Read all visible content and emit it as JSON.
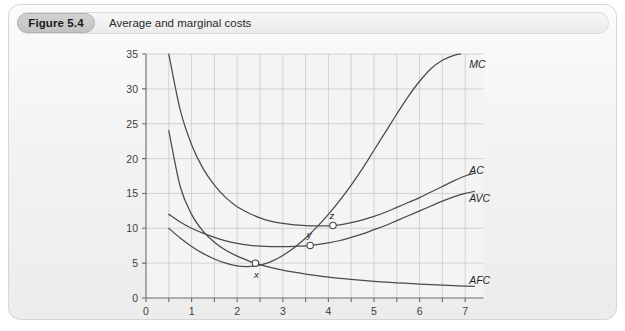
{
  "figure": {
    "badge": "Figure 5.4",
    "caption": "Average and marginal costs"
  },
  "chart_data": {
    "type": "line",
    "title": "Average and marginal costs",
    "xlabel": "",
    "ylabel": "",
    "xlim": [
      0,
      7.4
    ],
    "ylim": [
      0,
      35
    ],
    "xticks": [
      "0",
      "1",
      "2",
      "3",
      "4",
      "5",
      "6",
      "7"
    ],
    "xtick_values": [
      0,
      1,
      2,
      3,
      4,
      5,
      6,
      7
    ],
    "yticks": [
      "0",
      "5",
      "10",
      "15",
      "20",
      "25",
      "30",
      "35"
    ],
    "ytick_values": [
      0,
      5,
      10,
      15,
      20,
      25,
      30,
      35
    ],
    "grid": true,
    "grid_x_step": 0.5,
    "grid_y_step": 5,
    "legend_position": "inline-right",
    "series": [
      {
        "name": "MC",
        "label": "MC",
        "label_x": 7.0,
        "label_y": 33.6,
        "x": [
          0.5,
          0.75,
          1.0,
          1.25,
          1.5,
          1.75,
          2.0,
          2.2,
          2.4,
          2.6,
          2.8,
          3.0,
          3.25,
          3.5,
          3.75,
          4.0,
          4.25,
          4.5,
          4.75,
          5.0,
          5.25,
          5.5,
          5.75,
          6.0,
          6.25,
          6.5,
          6.75,
          6.9
        ],
        "y": [
          10.0,
          8.6,
          7.4,
          6.4,
          5.6,
          5.0,
          4.6,
          4.5,
          4.6,
          4.9,
          5.4,
          6.1,
          7.2,
          8.6,
          10.2,
          12.0,
          14.0,
          16.2,
          18.6,
          21.2,
          23.8,
          26.4,
          28.9,
          31.1,
          32.9,
          34.1,
          34.8,
          35.0
        ]
      },
      {
        "name": "AC",
        "label": "AC",
        "label_x": 7.0,
        "label_y": 18.4,
        "x": [
          0.5,
          0.75,
          1.0,
          1.25,
          1.5,
          1.75,
          2.0,
          2.25,
          2.5,
          2.75,
          3.0,
          3.25,
          3.5,
          3.75,
          4.0,
          4.1,
          4.25,
          4.5,
          4.75,
          5.0,
          5.25,
          5.5,
          5.75,
          6.0,
          6.25,
          6.5,
          6.75,
          7.0,
          7.2
        ],
        "y": [
          35.0,
          27.0,
          22.0,
          18.6,
          16.2,
          14.4,
          13.1,
          12.2,
          11.5,
          11.0,
          10.7,
          10.5,
          10.4,
          10.35,
          10.35,
          10.4,
          10.5,
          10.8,
          11.2,
          11.7,
          12.3,
          13.0,
          13.7,
          14.4,
          15.2,
          16.0,
          16.8,
          17.5,
          17.9
        ]
      },
      {
        "name": "AVC",
        "label": "AVC",
        "label_x": 7.0,
        "label_y": 14.3,
        "x": [
          0.5,
          0.75,
          1.0,
          1.25,
          1.5,
          1.75,
          2.0,
          2.25,
          2.5,
          2.75,
          3.0,
          3.25,
          3.5,
          3.6,
          3.75,
          4.0,
          4.25,
          4.5,
          4.75,
          5.0,
          5.25,
          5.5,
          5.75,
          6.0,
          6.25,
          6.5,
          6.75,
          7.0,
          7.2
        ],
        "y": [
          12.0,
          10.9,
          10.0,
          9.3,
          8.7,
          8.2,
          7.85,
          7.6,
          7.45,
          7.38,
          7.36,
          7.4,
          7.48,
          7.55,
          7.65,
          7.9,
          8.25,
          8.7,
          9.2,
          9.8,
          10.4,
          11.1,
          11.8,
          12.5,
          13.2,
          13.9,
          14.5,
          15.0,
          15.3
        ]
      },
      {
        "name": "AFC",
        "label": "AFC",
        "label_x": 7.0,
        "label_y": 2.6,
        "x": [
          0.5,
          0.75,
          1.0,
          1.25,
          1.5,
          1.75,
          2.0,
          2.25,
          2.4,
          2.5,
          2.75,
          3.0,
          3.25,
          3.5,
          3.75,
          4.0,
          4.25,
          4.5,
          4.75,
          5.0,
          5.25,
          5.5,
          5.75,
          6.0,
          6.25,
          6.5,
          6.75,
          7.0,
          7.2
        ],
        "y": [
          24.0,
          16.0,
          12.0,
          9.6,
          8.0,
          6.85,
          6.0,
          5.33,
          5.0,
          4.8,
          4.36,
          4.0,
          3.7,
          3.43,
          3.2,
          3.0,
          2.82,
          2.67,
          2.53,
          2.4,
          2.29,
          2.18,
          2.09,
          2.0,
          1.92,
          1.85,
          1.78,
          1.71,
          1.67
        ]
      }
    ],
    "annotations": [
      {
        "label": "x",
        "x": 2.4,
        "y": 5.0,
        "label_dx": 1,
        "label_dy": 15
      },
      {
        "label": "y",
        "x": 3.6,
        "y": 7.55,
        "label_dx": -1,
        "label_dy": -7
      },
      {
        "label": "z",
        "x": 4.1,
        "y": 10.4,
        "label_dx": -1,
        "label_dy": -7
      }
    ],
    "colors": {
      "curve": "#4a4a4a",
      "grid": "#c9c9c9",
      "axis": "#6b6b6b",
      "text": "#3d3d3d",
      "plot_bg": "#f4f4f4"
    }
  }
}
